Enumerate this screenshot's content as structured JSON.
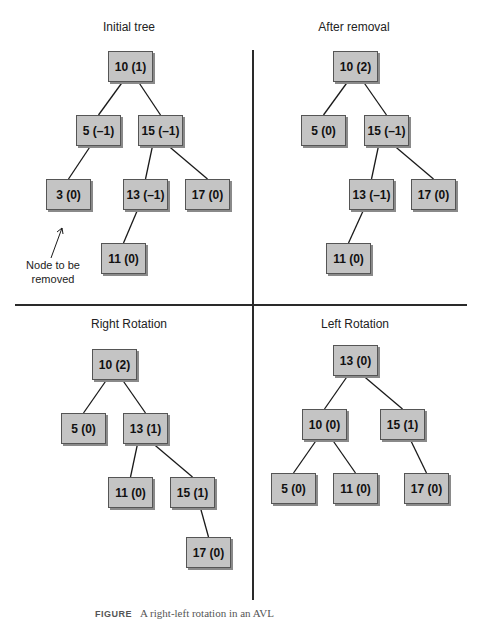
{
  "panels": [
    {
      "title": "Initial tree",
      "nodes": [
        {
          "id": "n10",
          "label": "10 (1)",
          "x": 108,
          "y": 51
        },
        {
          "id": "n5",
          "label": "5 (–1)",
          "x": 76,
          "y": 115
        },
        {
          "id": "n15",
          "label": "15 (–1)",
          "x": 138,
          "y": 115
        },
        {
          "id": "n3",
          "label": "3 (0)",
          "x": 46,
          "y": 179
        },
        {
          "id": "n13",
          "label": "13 (–1)",
          "x": 123,
          "y": 179
        },
        {
          "id": "n17",
          "label": "17 (0)",
          "x": 185,
          "y": 179
        },
        {
          "id": "n11",
          "label": "11 (0)",
          "x": 101,
          "y": 243
        }
      ],
      "edges": [
        [
          "n10",
          "n5"
        ],
        [
          "n10",
          "n15"
        ],
        [
          "n5",
          "n3"
        ],
        [
          "n15",
          "n13"
        ],
        [
          "n15",
          "n17"
        ],
        [
          "n13",
          "n11"
        ]
      ]
    },
    {
      "title": "After removal",
      "nodes": [
        {
          "id": "n10",
          "label": "10 (2)",
          "x": 333,
          "y": 51
        },
        {
          "id": "n5",
          "label": "5 (0)",
          "x": 301,
          "y": 115
        },
        {
          "id": "n15",
          "label": "15 (–1)",
          "x": 364,
          "y": 115
        },
        {
          "id": "n13",
          "label": "13 (–1)",
          "x": 349,
          "y": 179
        },
        {
          "id": "n17",
          "label": "17 (0)",
          "x": 411,
          "y": 179
        },
        {
          "id": "n11",
          "label": "11 (0)",
          "x": 326,
          "y": 243
        }
      ],
      "edges": [
        [
          "n10",
          "n5"
        ],
        [
          "n10",
          "n15"
        ],
        [
          "n15",
          "n13"
        ],
        [
          "n15",
          "n17"
        ],
        [
          "n13",
          "n11"
        ]
      ]
    },
    {
      "title": "Right Rotation",
      "nodes": [
        {
          "id": "n10",
          "label": "10 (2)",
          "x": 92,
          "y": 349
        },
        {
          "id": "n5",
          "label": "5 (0)",
          "x": 61,
          "y": 413
        },
        {
          "id": "n13",
          "label": "13 (1)",
          "x": 123,
          "y": 413
        },
        {
          "id": "n11",
          "label": "11 (0)",
          "x": 108,
          "y": 477
        },
        {
          "id": "n15",
          "label": "15 (1)",
          "x": 170,
          "y": 477
        },
        {
          "id": "n17",
          "label": "17 (0)",
          "x": 186,
          "y": 537
        }
      ],
      "edges": [
        [
          "n10",
          "n5"
        ],
        [
          "n10",
          "n13"
        ],
        [
          "n13",
          "n11"
        ],
        [
          "n13",
          "n15"
        ],
        [
          "n15",
          "n17"
        ]
      ]
    },
    {
      "title": "Left Rotation",
      "nodes": [
        {
          "id": "n13",
          "label": "13 (0)",
          "x": 333,
          "y": 345
        },
        {
          "id": "n10",
          "label": "10 (0)",
          "x": 302,
          "y": 409
        },
        {
          "id": "n15",
          "label": "15 (1)",
          "x": 380,
          "y": 409
        },
        {
          "id": "n5",
          "label": "5 (0)",
          "x": 271,
          "y": 473
        },
        {
          "id": "n11",
          "label": "11 (0)",
          "x": 333,
          "y": 473
        },
        {
          "id": "n17",
          "label": "17 (0)",
          "x": 404,
          "y": 473
        }
      ],
      "edges": [
        [
          "n13",
          "n10"
        ],
        [
          "n13",
          "n15"
        ],
        [
          "n10",
          "n5"
        ],
        [
          "n10",
          "n11"
        ],
        [
          "n15",
          "n17"
        ]
      ]
    }
  ],
  "annotation": {
    "line1": "Node to be",
    "line2": "removed"
  },
  "caption": {
    "label": "FIGURE",
    "text": "A right-left rotation in an AVL"
  }
}
